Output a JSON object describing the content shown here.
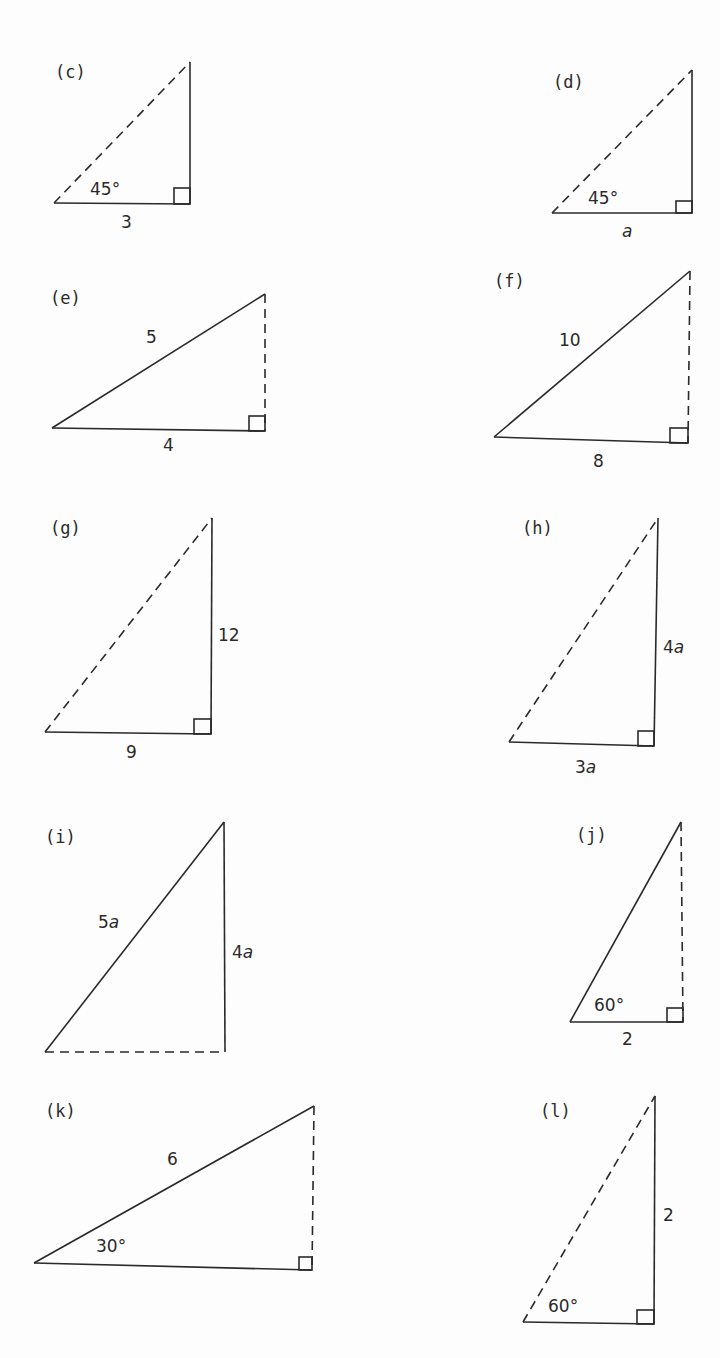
{
  "figure": {
    "triangles": [
      {
        "id": "c",
        "label": "(c)",
        "angle": "45°",
        "base": "3",
        "vertical": "",
        "hypotenuse": "",
        "dashed": "hypotenuse",
        "pts": {
          "left": [
            54,
            203
          ],
          "top": [
            190,
            62
          ],
          "corner": [
            190,
            204
          ]
        }
      },
      {
        "id": "d",
        "label": "(d)",
        "angle": "45°",
        "base": "a",
        "vertical": "",
        "hypotenuse": "",
        "dashed": "hypotenuse",
        "pts": {
          "left": [
            552,
            213
          ],
          "top": [
            692,
            70
          ],
          "corner": [
            692,
            213
          ]
        }
      },
      {
        "id": "e",
        "label": "(e)",
        "angle": "",
        "base": "4",
        "vertical": "",
        "hypotenuse": "5",
        "dashed": "vertical",
        "pts": {
          "left": [
            52,
            428
          ],
          "top": [
            265,
            294
          ],
          "corner": [
            265,
            431
          ]
        }
      },
      {
        "id": "f",
        "label": "(f)",
        "angle": "",
        "base": "8",
        "vertical": "",
        "hypotenuse": "10",
        "dashed": "vertical",
        "pts": {
          "left": [
            494,
            437
          ],
          "top": [
            690,
            271
          ],
          "corner": [
            688,
            443
          ]
        }
      },
      {
        "id": "g",
        "label": "(g)",
        "angle": "",
        "base": "9",
        "vertical": "12",
        "hypotenuse": "",
        "dashed": "hypotenuse",
        "pts": {
          "left": [
            45,
            732
          ],
          "top": [
            212,
            518
          ],
          "corner": [
            211,
            734
          ]
        }
      },
      {
        "id": "h",
        "label": "(h)",
        "angle": "",
        "base": "3a",
        "vertical": "4a",
        "hypotenuse": "",
        "dashed": "hypotenuse",
        "pts": {
          "left": [
            509,
            742
          ],
          "top": [
            658,
            518
          ],
          "corner": [
            654,
            746
          ]
        }
      },
      {
        "id": "i",
        "label": "(i)",
        "angle": "",
        "base": "",
        "vertical": "4a",
        "hypotenuse": "5a",
        "dashed": "base",
        "pts": {
          "left": [
            45,
            1052
          ],
          "top": [
            224,
            822
          ],
          "corner": [
            225,
            1052
          ]
        }
      },
      {
        "id": "j",
        "label": "(j)",
        "angle": "60°",
        "base": "2",
        "vertical": "",
        "hypotenuse": "",
        "dashed": "vertical",
        "pts": {
          "left": [
            570,
            1022
          ],
          "top": [
            681,
            822
          ],
          "corner": [
            683,
            1022
          ]
        }
      },
      {
        "id": "k",
        "label": "(k)",
        "angle": "30°",
        "base": "",
        "vertical": "",
        "hypotenuse": "6",
        "dashed": "vertical",
        "pts": {
          "left": [
            34,
            1263
          ],
          "top": [
            314,
            1106
          ],
          "corner": [
            312,
            1270
          ]
        }
      },
      {
        "id": "l",
        "label": "(l)",
        "angle": "60°",
        "base": "",
        "vertical": "2",
        "hypotenuse": "",
        "dashed": "hypotenuse",
        "pts": {
          "left": [
            523,
            1322
          ],
          "top": [
            655,
            1096
          ],
          "corner": [
            654,
            1324
          ]
        }
      }
    ],
    "text": {
      "c_label": "(c)",
      "c_angle": "45°",
      "c_base": "3",
      "d_label": "(d)",
      "d_angle": "45°",
      "d_base": "a",
      "e_label": "(e)",
      "e_hyp": "5",
      "e_base": "4",
      "f_label": "(f)",
      "f_hyp": "10",
      "f_base": "8",
      "g_label": "(g)",
      "g_vert": "12",
      "g_base": "9",
      "h_label": "(h)",
      "h_vert_num": "4",
      "h_vert_var": "a",
      "h_base_num": "3",
      "h_base_var": "a",
      "i_label": "(i)",
      "i_hyp_num": "5",
      "i_hyp_var": "a",
      "i_vert_num": "4",
      "i_vert_var": "a",
      "j_label": "(j)",
      "j_angle": "60°",
      "j_base": "2",
      "k_label": "(k)",
      "k_hyp": "6",
      "k_angle": "30°",
      "l_label": "(l)",
      "l_vert": "2",
      "l_angle": "60°"
    }
  }
}
